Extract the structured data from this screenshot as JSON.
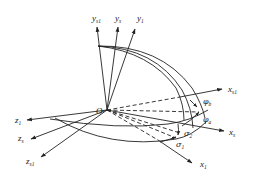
{
  "diagram": {
    "type": "coordinate-system-rotation",
    "origin": {
      "label": "O"
    },
    "axes": {
      "y_s1": {
        "base": "y",
        "sub": "s1"
      },
      "y_s": {
        "base": "y",
        "sub": "s"
      },
      "y_1": {
        "base": "y",
        "sub": "1"
      },
      "x_s1": {
        "base": "x",
        "sub": "s1"
      },
      "x_s": {
        "base": "x",
        "sub": "s"
      },
      "x_1": {
        "base": "x",
        "sub": "1"
      },
      "z_1": {
        "base": "z",
        "sub": "1"
      },
      "z_s": {
        "base": "z",
        "sub": "s"
      },
      "z_s1": {
        "base": "z",
        "sub": "s1"
      }
    },
    "angles": {
      "phi_b": {
        "base": "φ",
        "sub": "b"
      },
      "phi_a": {
        "base": "φ",
        "sub": "a"
      },
      "sigma_2": {
        "base": "σ",
        "sub": "2"
      },
      "sigma_1": {
        "base": "σ",
        "sub": "1"
      }
    }
  }
}
